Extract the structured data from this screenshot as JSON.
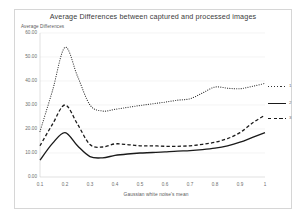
{
  "chart_data": {
    "type": "line",
    "title": "Average Differences between captured and processed images",
    "xlabel": "Gaussian white noise's mean",
    "ylabel": "Average Differences",
    "xlim": [
      0.1,
      1.0
    ],
    "ylim": [
      0,
      60
    ],
    "grid": true,
    "legend_position": "right",
    "x": [
      0.1,
      0.15,
      0.2,
      0.25,
      0.3,
      0.35,
      0.4,
      0.45,
      0.5,
      0.55,
      0.6,
      0.65,
      0.7,
      0.75,
      0.8,
      0.85,
      0.9,
      0.95,
      1.0
    ],
    "x_tick_labels": [
      "0.1",
      "0.2",
      "0.3",
      "0.4",
      "0.5",
      "0.6",
      "0.7",
      "0.8",
      "0.9",
      "1"
    ],
    "y_tick_labels": [
      "0.00",
      "10.00",
      "20.00",
      "30.00",
      "40.00",
      "50.00",
      "60.00"
    ],
    "y_ticks": [
      0,
      10,
      20,
      30,
      40,
      50,
      60
    ],
    "series": [
      {
        "name": "1",
        "style": "dotted",
        "color": "#333333",
        "values": [
          19.0,
          36.0,
          54.0,
          42.0,
          30.0,
          27.5,
          28.2,
          29.0,
          29.8,
          30.5,
          31.2,
          32.0,
          32.6,
          35.0,
          37.5,
          37.0,
          36.8,
          37.8,
          39.0
        ]
      },
      {
        "name": "2",
        "style": "solid",
        "color": "#1a1a1a",
        "values": [
          7.0,
          14.0,
          18.5,
          13.0,
          8.5,
          8.0,
          9.0,
          9.6,
          10.0,
          10.2,
          10.5,
          10.8,
          11.0,
          11.4,
          12.0,
          13.0,
          14.5,
          16.5,
          18.5
        ]
      },
      {
        "name": "3",
        "style": "dashed",
        "color": "#1a1a1a",
        "values": [
          13.0,
          22.0,
          30.0,
          22.0,
          13.5,
          12.5,
          13.8,
          13.5,
          13.0,
          13.0,
          12.8,
          12.8,
          13.0,
          13.6,
          14.5,
          16.0,
          18.5,
          22.5,
          25.8
        ]
      }
    ]
  },
  "legend": {
    "entries": [
      {
        "label": "1"
      },
      {
        "label": "2"
      },
      {
        "label": "3"
      }
    ]
  }
}
